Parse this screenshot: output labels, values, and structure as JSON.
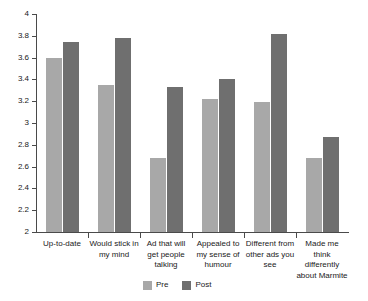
{
  "chart_data": {
    "type": "bar",
    "title": "",
    "subtitle": "",
    "xlabel": "",
    "ylabel": "",
    "ylim": [
      2,
      4
    ],
    "yticks": [
      "2",
      "2.2",
      "2.4",
      "2.6",
      "2.8",
      "3",
      "3.2",
      "3.4",
      "3.6",
      "3.8",
      "4"
    ],
    "ytick_values": [
      2,
      2.2,
      2.4,
      2.6,
      2.8,
      3,
      3.2,
      3.4,
      3.6,
      3.8,
      4
    ],
    "grid": false,
    "legend_position": "bottom",
    "categories": [
      "Up-to-date",
      "Would stick in my mind",
      "Ad that will get people talking",
      "Appealed to my sense of humour",
      "Different from other ads you see",
      "Made me think differently about Marmite"
    ],
    "series": [
      {
        "name": "Pre",
        "color": "#a8a8a8",
        "values": [
          3.6,
          3.35,
          2.68,
          3.22,
          3.19,
          2.68
        ]
      },
      {
        "name": "Post",
        "color": "#6f6f6f",
        "values": [
          3.74,
          3.78,
          3.33,
          3.4,
          3.82,
          2.87
        ]
      }
    ]
  },
  "legend": {
    "items": [
      {
        "label": "Pre",
        "color": "#a8a8a8"
      },
      {
        "label": "Post",
        "color": "#6f6f6f"
      }
    ]
  }
}
